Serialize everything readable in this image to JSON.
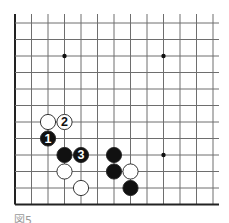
{
  "diagram": {
    "type": "go-board-fragment",
    "grid": {
      "columns": 13,
      "rows": 12,
      "origin_x": 15,
      "origin_y": 23,
      "spacing_x": 16.5,
      "spacing_y": 16.5,
      "top_line_extend": 9,
      "right_line_extend": 6,
      "edges": [
        "left",
        "bottom"
      ],
      "line_color": "#6e6e6e",
      "edge_color": "#222222"
    },
    "star_points": [
      {
        "col": 3,
        "row": 2
      },
      {
        "col": 9,
        "row": 2
      },
      {
        "col": 9,
        "row": 8
      }
    ],
    "stones": [
      {
        "color": "white",
        "col": 2,
        "row": 6,
        "label": ""
      },
      {
        "color": "white",
        "col": 3,
        "row": 6,
        "label": "2"
      },
      {
        "color": "black",
        "col": 2,
        "row": 7,
        "label": "1"
      },
      {
        "color": "black",
        "col": 3,
        "row": 8,
        "label": ""
      },
      {
        "color": "black",
        "col": 4,
        "row": 8,
        "label": "3"
      },
      {
        "color": "white",
        "col": 3,
        "row": 9,
        "label": ""
      },
      {
        "color": "white",
        "col": 4,
        "row": 10,
        "label": ""
      },
      {
        "color": "black",
        "col": 6,
        "row": 8,
        "label": ""
      },
      {
        "color": "black",
        "col": 6,
        "row": 9,
        "label": ""
      },
      {
        "color": "white",
        "col": 7,
        "row": 9,
        "label": ""
      },
      {
        "color": "black",
        "col": 7,
        "row": 10,
        "label": ""
      }
    ],
    "caption": "図5"
  }
}
